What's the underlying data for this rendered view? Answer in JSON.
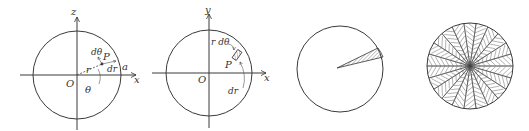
{
  "figures": [
    {
      "id": "fig1",
      "labels": {
        "z_axis": "z",
        "x_axis": "x",
        "origin": "O",
        "r": "r",
        "point": "P",
        "d_theta": "dθ",
        "d_r": "dr",
        "a": "a",
        "theta": "θ"
      }
    },
    {
      "id": "fig2",
      "labels": {
        "y_axis": "y",
        "x_axis": "x",
        "origin": "O",
        "point": "P",
        "r_d_theta": "r dθ",
        "d_r": "dr"
      }
    },
    {
      "id": "fig3",
      "description": "circle with one shaded thin sector"
    },
    {
      "id": "fig4",
      "description": "circle filled with many hatched sectors"
    }
  ],
  "colors": {
    "line": "#3a3a3a",
    "background": "#ffffff"
  }
}
